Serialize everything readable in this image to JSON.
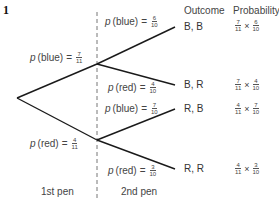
{
  "question_number": "1",
  "headers": {
    "outcome": "Outcome",
    "probability": "Probability"
  },
  "stages": {
    "first": "1st pen",
    "second": "2nd pen"
  },
  "first_pen": {
    "blue": {
      "prefix": "p",
      "label": "(blue)",
      "eq": "=",
      "num": "7",
      "den": "11"
    },
    "red": {
      "prefix": "p",
      "label": "(red)",
      "eq": "=",
      "num": "4",
      "den": "11"
    }
  },
  "second_pen": {
    "after_blue": {
      "blue": {
        "prefix": "p",
        "label": "(blue)",
        "eq": "=",
        "num": "6",
        "den": "10"
      },
      "red": {
        "prefix": "p",
        "label": "(red)",
        "eq": "=",
        "num": "4",
        "den": "10"
      }
    },
    "after_red": {
      "blue": {
        "prefix": "p",
        "label": "(blue)",
        "eq": "=",
        "num": "7",
        "den": "10"
      },
      "red": {
        "prefix": "p",
        "label": "(red)",
        "eq": "=",
        "num": "3",
        "den": "10"
      }
    }
  },
  "outcomes": [
    {
      "outcome": "B, B",
      "a_num": "7",
      "a_den": "11",
      "times": "×",
      "b_num": "6",
      "b_den": "10"
    },
    {
      "outcome": "B, R",
      "a_num": "7",
      "a_den": "11",
      "times": "×",
      "b_num": "4",
      "b_den": "10"
    },
    {
      "outcome": "R, B",
      "a_num": "4",
      "a_den": "11",
      "times": "×",
      "b_num": "7",
      "b_den": "10"
    },
    {
      "outcome": "R, R",
      "a_num": "4",
      "a_den": "11",
      "times": "×",
      "b_num": "3",
      "b_den": "10"
    }
  ],
  "colors": {
    "line": "#1a1a1a",
    "dashed": "#777777",
    "text": "#444444"
  }
}
